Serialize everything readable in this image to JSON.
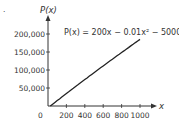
{
  "chart_data": {
    "type": "line",
    "title": "",
    "annotation": "P(x) = 200x − 0.01x² − 5000",
    "function": {
      "a2": -0.01,
      "a1": 200,
      "a0": -5000
    },
    "series": [
      {
        "name": "P(x)",
        "x": [
          0,
          200,
          400,
          600,
          800,
          1000
        ],
        "y": [
          -5000,
          34600,
          73400,
          111400,
          148600,
          185000
        ]
      }
    ],
    "xlabel": "x",
    "ylabel": "P(x)",
    "origin_label": "0",
    "x_ticks": [
      200,
      400,
      600,
      800,
      1000
    ],
    "x_tick_labels": [
      "200",
      "400",
      "600",
      "800",
      "1000"
    ],
    "y_ticks": [
      50000,
      100000,
      150000,
      200000
    ],
    "y_tick_labels": [
      "50,000",
      "100,000",
      "150,000",
      "200,000"
    ],
    "xlim": [
      0,
      1000
    ],
    "ylim": [
      0,
      200000
    ],
    "grid": false,
    "legend": "none",
    "color": "#222222"
  },
  "marker": "."
}
